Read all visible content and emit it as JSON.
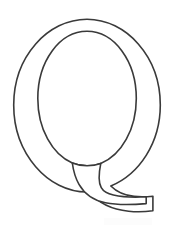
{
  "page": {
    "kind": "coloring-page-letter-outline",
    "width": 173,
    "height": 236,
    "background_color": "#ffffff"
  },
  "artwork": {
    "name": "letter-q-outline",
    "character": "Q",
    "description": "Uppercase letter Q drawn as a hollow black outline on a white background",
    "style": "serif-didone-outline",
    "stroke_color": "#3a3a3a",
    "fill_color": "#ffffff",
    "stroke_width": 1.6,
    "geometry": {
      "outer_bowl": {
        "center_x": 87,
        "center_y": 105,
        "radius_x": 73,
        "radius_y": 86,
        "left": 14,
        "right": 160,
        "top": 19,
        "bottom": 191
      },
      "inner_counter": {
        "center_x": 87,
        "center_y": 98,
        "radius_x": 49,
        "radius_y": 67,
        "left": 38,
        "right": 136,
        "top": 31,
        "bottom": 165
      },
      "tail": {
        "start_left_x": 73,
        "start_left_y": 172,
        "start_right_x": 100,
        "start_right_y": 168,
        "end_x": 153,
        "end_top_y": 196,
        "end_bottom_y": 211,
        "direction": "descends-then-sweeps-right",
        "terminal": "flat-vertical-cut"
      }
    }
  },
  "marks": {
    "faint_smudge": {
      "name": "faint-bottom-smudge",
      "visible": "barely",
      "x": 104,
      "y": 218,
      "width": 48,
      "height": 7
    }
  }
}
